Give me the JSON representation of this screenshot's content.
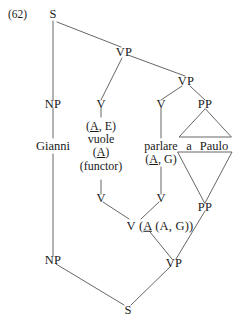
{
  "figure": {
    "example_number": "(62)",
    "sentence_words": [
      "Gianni",
      "vuole",
      "parlare",
      "a",
      "Paulo"
    ],
    "stroke_color": "#555555",
    "text_color": "#1a1a1a",
    "background_color": "#ffffff"
  },
  "nodes": {
    "top_s": "S",
    "vp_upper": "VP",
    "vp_lower": "VP",
    "np_upper": "NP",
    "v_vuole_upper": "V",
    "v_parlare_upper": "V",
    "pp_upper": "PP",
    "v_vuole_lower": "V",
    "v_parlare_lower": "V",
    "pp_lower": "PP",
    "v_composed": "V (A (A, G))",
    "np_lower": "NP",
    "vp_bottom": "VP",
    "bottom_s": "S"
  },
  "annotations": {
    "vuole_line1": "(A, E)",
    "vuole_word": "vuole",
    "vuole_line3": "(A)",
    "vuole_line4": "(functor)",
    "parlare_word": "parlare",
    "parlare_line2": "(A, G)",
    "pp_phrase_a": "a",
    "pp_phrase_paulo": "Paulo",
    "subject_word": "Gianni"
  }
}
